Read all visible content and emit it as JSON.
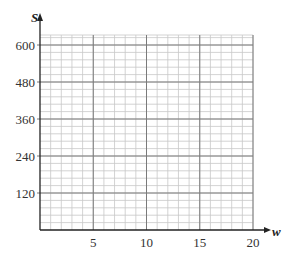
{
  "chart_data": {
    "type": "line",
    "title": "",
    "xlabel": "w",
    "ylabel": "S",
    "x_ticks": [
      5,
      10,
      15,
      20
    ],
    "y_ticks": [
      120,
      240,
      360,
      480,
      600
    ],
    "xlim": [
      0,
      20
    ],
    "ylim": [
      0,
      620
    ],
    "grid": true,
    "grid_minor_x_step": 1,
    "grid_minor_y_step": 24,
    "series": []
  },
  "colors": {
    "major_grid": "#7a7a7a",
    "minor_grid": "#c8c8c8",
    "axis": "#222222"
  }
}
